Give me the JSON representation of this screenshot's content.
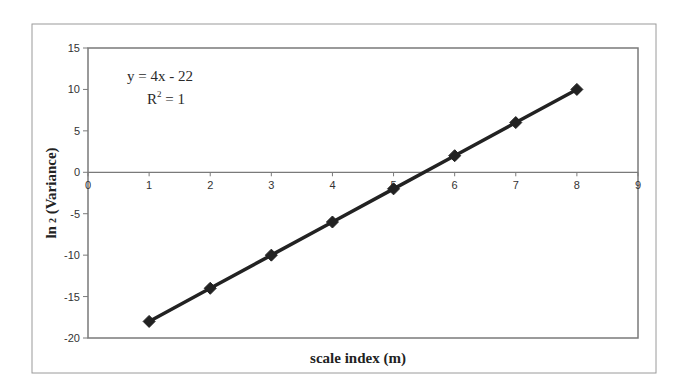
{
  "chart_data": {
    "type": "line",
    "title": "",
    "xlabel": "scale index (m)",
    "ylabel_main": "ln",
    "ylabel_sub": "2",
    "ylabel_rest": " (Variance)",
    "ylabel": "ln 2 (Variance)",
    "xlim": [
      0,
      9
    ],
    "ylim": [
      -20,
      15
    ],
    "x_ticks": [
      0,
      1,
      2,
      3,
      4,
      5,
      6,
      7,
      8,
      9
    ],
    "y_ticks": [
      15,
      10,
      5,
      0,
      -5,
      -10,
      -15,
      -20
    ],
    "grid": false,
    "legend": null,
    "series": [
      {
        "name": "ln2(Variance)",
        "marker": "diamond",
        "color": "#222222",
        "x": [
          1,
          2,
          3,
          4,
          5,
          6,
          7,
          8
        ],
        "values": [
          -18,
          -14,
          -10,
          -6,
          -2,
          2,
          6,
          10
        ]
      }
    ],
    "annotations": {
      "equation": "y = 4x - 22",
      "r_squared_prefix": "R",
      "r_squared_sup": "2",
      "r_squared_suffix": " = 1"
    },
    "trendline": {
      "slope": 4,
      "intercept": -22,
      "r_squared": 1
    }
  },
  "colors": {
    "frame": "#9a9a9a",
    "plot_border": "#7a7a7a",
    "series": "#222222"
  }
}
